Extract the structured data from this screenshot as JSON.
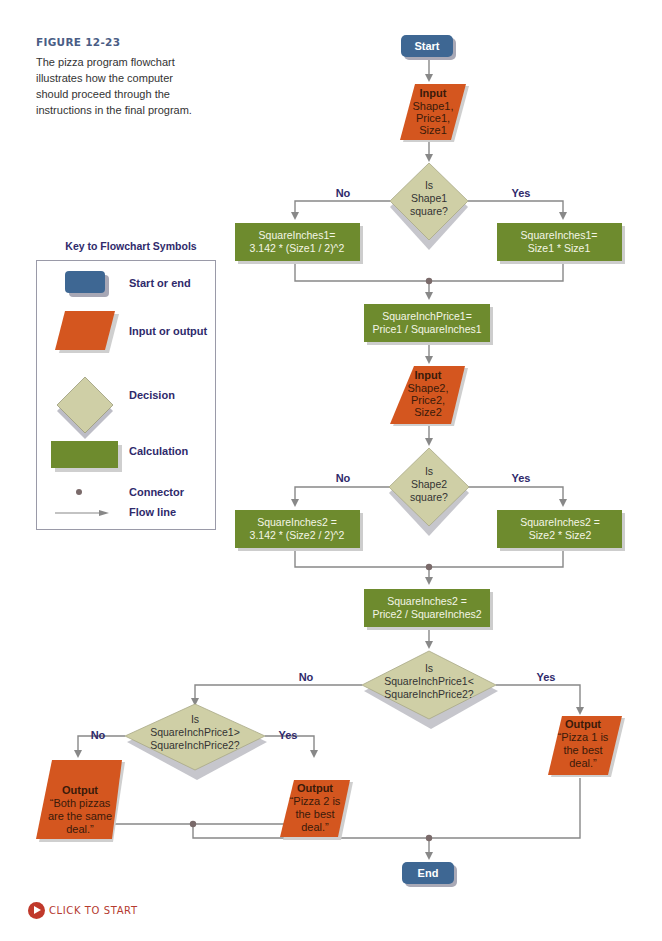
{
  "caption": {
    "figure_label": "FIGURE 12-23",
    "text": "The pizza program flowchart illustrates how the computer should proceed through the instructions in the final program."
  },
  "key": {
    "title": "Key to Flowchart Symbols",
    "items": [
      {
        "symbol": "start-end",
        "label": "Start or end"
      },
      {
        "symbol": "input-output",
        "label": "Input or output"
      },
      {
        "symbol": "decision",
        "label": "Decision"
      },
      {
        "symbol": "calculation",
        "label": "Calculation"
      },
      {
        "symbol": "connector",
        "label": "Connector"
      },
      {
        "symbol": "flow-line",
        "label": "Flow line"
      }
    ]
  },
  "colors": {
    "terminal": "#3e6793",
    "io": "#d4561f",
    "decision": "#cfcfa6",
    "calculation": "#6e8b2e",
    "line": "#888888",
    "connector": "#7a6a6a",
    "branch_label": "#2f2a6b",
    "io_text": "#3a1a0a"
  },
  "flowchart": {
    "start": "Start",
    "end": "End",
    "input1": {
      "title": "Input",
      "lines": [
        "Shape1,",
        "Price1,",
        "Size1"
      ]
    },
    "decision1": {
      "lines": [
        "Is",
        "Shape1",
        "square?"
      ],
      "no": "No",
      "yes": "Yes"
    },
    "calc1_no": {
      "lines": [
        "SquareInches1=",
        "3.142 * (Size1 / 2)^2"
      ]
    },
    "calc1_yes": {
      "lines": [
        "SquareInches1=",
        "Size1 * Size1"
      ]
    },
    "calc_price1": {
      "lines": [
        "SquareInchPrice1=",
        "Price1 / SquareInches1"
      ]
    },
    "input2": {
      "title": "Input",
      "lines": [
        "Shape2,",
        "Price2,",
        "Size2"
      ]
    },
    "decision2": {
      "lines": [
        "Is",
        "Shape2",
        "square?"
      ],
      "no": "No",
      "yes": "Yes"
    },
    "calc2_no": {
      "lines": [
        "SquareInches2 =",
        "3.142 * (Size2 / 2)^2"
      ]
    },
    "calc2_yes": {
      "lines": [
        "SquareInches2 =",
        "Size2 * Size2"
      ]
    },
    "calc_price2": {
      "lines": [
        "SquareInches2 =",
        "Price2 / SquareInches2"
      ]
    },
    "decision3": {
      "lines": [
        "Is",
        "SquareInchPrice1<",
        "SquareInchPrice2?"
      ],
      "no": "No",
      "yes": "Yes"
    },
    "decision4": {
      "lines": [
        "Is",
        "SquareInchPrice1>",
        "SquareInchPrice2?"
      ],
      "no": "No",
      "yes": "Yes"
    },
    "output_same": {
      "title": "Output",
      "lines": [
        "“Both pizzas",
        "are the same",
        "deal.”"
      ]
    },
    "output_pizza2": {
      "title": "Output",
      "lines": [
        "“Pizza 2 is",
        "the best",
        "deal.”"
      ]
    },
    "output_pizza1": {
      "title": "Output",
      "lines": [
        "“Pizza 1 is",
        "the best",
        "deal.”"
      ]
    }
  },
  "click_to_start": "CLICK TO START"
}
